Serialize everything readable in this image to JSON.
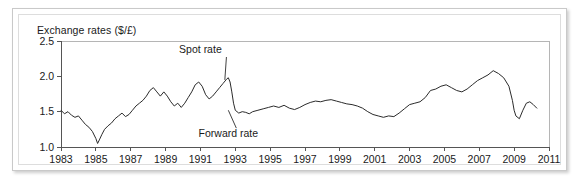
{
  "figure": {
    "title": "Exchange rates ($/£)",
    "frame_color": "#c9c9c9",
    "line_color": "#2b2b2b"
  },
  "chart_data": {
    "type": "line",
    "title": "Exchange rates ($/£)",
    "xlabel": "",
    "ylabel": "",
    "xlim": [
      1983,
      2011
    ],
    "ylim": [
      1.0,
      2.5
    ],
    "grid": false,
    "legend": "none",
    "x_ticks": [
      1983,
      1985,
      1987,
      1989,
      1991,
      1993,
      1995,
      1997,
      1999,
      2001,
      2003,
      2005,
      2007,
      2009,
      2011
    ],
    "y_ticks": [
      1.0,
      1.5,
      2.0,
      2.5
    ],
    "annotations": [
      {
        "text": "Spot rate",
        "x": 1991.0,
        "y": 2.33,
        "points_to_x": 1992.4,
        "points_to_y": 1.95
      },
      {
        "text": "Forward rate",
        "x": 1992.6,
        "y": 1.14,
        "points_to_x": 1992.6,
        "points_to_y": 1.52
      }
    ],
    "series": [
      {
        "name": "Spot rate",
        "x": [
          1983.0,
          1983.2,
          1983.4,
          1983.6,
          1983.8,
          1984.0,
          1984.2,
          1984.4,
          1984.6,
          1984.8,
          1985.0,
          1985.1,
          1985.2,
          1985.35,
          1985.5,
          1985.7,
          1985.9,
          1986.1,
          1986.3,
          1986.5,
          1986.7,
          1986.9,
          1987.1,
          1987.3,
          1987.5,
          1987.7,
          1987.9,
          1988.1,
          1988.3,
          1988.5,
          1988.7,
          1988.9,
          1989.1,
          1989.3,
          1989.5,
          1989.7,
          1989.9,
          1990.1,
          1990.3,
          1990.5,
          1990.7,
          1990.9,
          1991.1,
          1991.3,
          1991.5,
          1991.7,
          1991.9,
          1992.1,
          1992.3,
          1992.5,
          1992.6,
          1992.7,
          1992.8,
          1992.9,
          1993.0,
          1993.2,
          1993.4,
          1993.6,
          1993.8,
          1994.0,
          1994.3,
          1994.6,
          1994.9,
          1995.2,
          1995.5,
          1995.8,
          1996.1,
          1996.4,
          1996.7,
          1997.0,
          1997.3,
          1997.6,
          1997.9,
          1998.2,
          1998.5,
          1998.8,
          1999.1,
          1999.4,
          1999.7,
          2000.0,
          2000.3,
          2000.6,
          2000.9,
          2001.2,
          2001.5,
          2001.8,
          2002.1,
          2002.4,
          2002.7,
          2003.0,
          2003.3,
          2003.6,
          2003.9,
          2004.2,
          2004.5,
          2004.8,
          2005.1,
          2005.4,
          2005.7,
          2006.0,
          2006.3,
          2006.6,
          2006.9,
          2007.2,
          2007.5,
          2007.8,
          2008.1,
          2008.4,
          2008.7,
          2008.9,
          2009.0,
          2009.1,
          2009.3,
          2009.5,
          2009.7,
          2009.9,
          2010.1,
          2010.3
        ],
        "y": [
          1.52,
          1.47,
          1.5,
          1.45,
          1.42,
          1.44,
          1.38,
          1.32,
          1.28,
          1.22,
          1.12,
          1.05,
          1.1,
          1.18,
          1.25,
          1.3,
          1.34,
          1.4,
          1.44,
          1.48,
          1.43,
          1.46,
          1.52,
          1.58,
          1.62,
          1.66,
          1.72,
          1.8,
          1.84,
          1.78,
          1.72,
          1.78,
          1.72,
          1.64,
          1.58,
          1.62,
          1.56,
          1.62,
          1.7,
          1.78,
          1.88,
          1.92,
          1.86,
          1.74,
          1.68,
          1.72,
          1.78,
          1.84,
          1.9,
          1.96,
          1.98,
          1.92,
          1.78,
          1.62,
          1.52,
          1.48,
          1.5,
          1.49,
          1.47,
          1.5,
          1.52,
          1.54,
          1.56,
          1.58,
          1.56,
          1.59,
          1.55,
          1.53,
          1.56,
          1.6,
          1.63,
          1.65,
          1.64,
          1.66,
          1.67,
          1.65,
          1.63,
          1.61,
          1.6,
          1.58,
          1.55,
          1.5,
          1.46,
          1.44,
          1.42,
          1.44,
          1.43,
          1.48,
          1.54,
          1.6,
          1.62,
          1.64,
          1.7,
          1.8,
          1.82,
          1.86,
          1.88,
          1.84,
          1.8,
          1.78,
          1.82,
          1.88,
          1.94,
          1.98,
          2.02,
          2.08,
          2.04,
          1.98,
          1.86,
          1.66,
          1.52,
          1.44,
          1.4,
          1.52,
          1.62,
          1.64,
          1.6,
          1.55
        ]
      }
    ]
  }
}
